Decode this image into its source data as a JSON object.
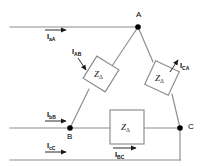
{
  "figure": {
    "type": "delta-connected three-phase circuit diagram",
    "background": "#ffffff",
    "line_color": "#808080",
    "accent_color": "#000000"
  },
  "nodes": [
    {
      "id": "A",
      "label": "A",
      "x": 138,
      "y": 27
    },
    {
      "id": "B",
      "label": "B",
      "x": 70,
      "y": 128
    },
    {
      "id": "C",
      "label": "C",
      "x": 180,
      "y": 128
    }
  ],
  "impedances": [
    {
      "id": "z-ab",
      "label": "Z",
      "subscript": "Δ",
      "branch": "A-B",
      "shape": "diamond"
    },
    {
      "id": "z-ca",
      "label": "Z",
      "subscript": "Δ",
      "branch": "C-A",
      "shape": "diamond"
    },
    {
      "id": "z-bc",
      "label": "Z",
      "subscript": "Δ",
      "branch": "B-C",
      "shape": "square"
    }
  ],
  "currents": {
    "line": [
      {
        "id": "i-aa",
        "symbol": "I",
        "subscript": "aA",
        "direction": "right"
      },
      {
        "id": "i-bb",
        "symbol": "I",
        "subscript": "bB",
        "direction": "right"
      },
      {
        "id": "i-cc",
        "symbol": "I",
        "subscript": "cC",
        "direction": "right"
      }
    ],
    "phase": [
      {
        "id": "i-ab",
        "symbol": "I",
        "subscript": "AB",
        "direction": "down-right"
      },
      {
        "id": "i-ca",
        "symbol": "I",
        "subscript": "CA",
        "direction": "up-right"
      },
      {
        "id": "i-bc",
        "symbol": "I",
        "subscript": "BC",
        "direction": "right"
      }
    ]
  }
}
